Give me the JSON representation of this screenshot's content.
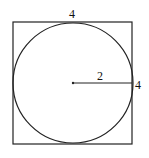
{
  "diagram": {
    "square": {
      "x": 13,
      "y": 22,
      "size": 120,
      "stroke": "#222"
    },
    "circle": {
      "cx": 73,
      "cy": 83,
      "r": 60,
      "stroke": "#222"
    },
    "radius_line": {
      "x1": 73,
      "y1": 83,
      "x2": 133,
      "y2": 83
    },
    "labels": {
      "top_side": "4",
      "radius": "2",
      "right_side": "4"
    }
  }
}
